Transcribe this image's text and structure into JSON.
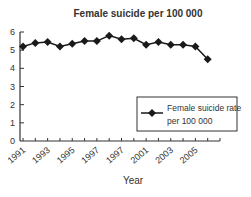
{
  "chart_data": {
    "type": "line",
    "title": "Female suicide per 100 000",
    "xlabel": "Year",
    "ylabel": "",
    "x": [
      1991,
      1992,
      1993,
      1994,
      1995,
      1996,
      1997,
      1998,
      1999,
      2000,
      2001,
      2002,
      2003,
      2004,
      2005,
      2006
    ],
    "series": [
      {
        "name": "Female suicide rate per 100 000",
        "values": [
          5.2,
          5.4,
          5.45,
          5.2,
          5.35,
          5.5,
          5.5,
          5.8,
          5.6,
          5.65,
          5.3,
          5.45,
          5.3,
          5.3,
          5.2,
          4.5
        ],
        "marker": "diamond",
        "color": "#1a1a1a"
      }
    ],
    "ylim": [
      0,
      6
    ],
    "xlim": [
      1991,
      2007
    ],
    "yticks": [
      "0",
      "1",
      "2",
      "3",
      "4",
      "5",
      "6"
    ],
    "xtick_labels": [
      "1991",
      "1993",
      "1995",
      "1997",
      "1997",
      "2001",
      "2003",
      "2005"
    ],
    "grid": false,
    "legend": {
      "position": "right",
      "line1": "Female suicide rate",
      "line2": "per 100 000"
    }
  }
}
